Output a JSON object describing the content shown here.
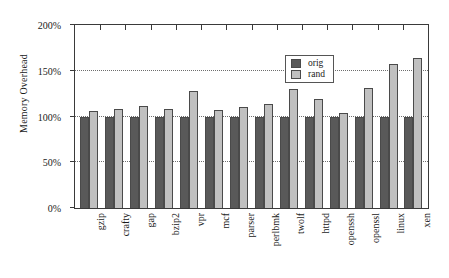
{
  "chart_data": {
    "type": "bar",
    "title": "",
    "xlabel": "",
    "ylabel": "Memory Overhead",
    "ylim": [
      0,
      200
    ],
    "yticks": [
      0,
      50,
      100,
      150,
      200
    ],
    "ytick_labels": [
      "0%",
      "50%",
      "100%",
      "150%",
      "200%"
    ],
    "grid": true,
    "grid_style": "dotted-horizontal",
    "legend_position": "top-right-inside",
    "categories": [
      "gzip",
      "crafty",
      "gap",
      "bzip2",
      "vpr",
      "mcf",
      "parser",
      "perlbmk",
      "twolf",
      "httpd",
      "openssh",
      "openssl",
      "linux",
      "xen"
    ],
    "series": [
      {
        "name": "orig",
        "color": "#595959",
        "values": [
          100,
          100,
          100,
          100,
          100,
          100,
          100,
          100,
          100,
          100,
          100,
          100,
          100,
          100
        ]
      },
      {
        "name": "rand",
        "color": "#c0c0c0",
        "values": [
          106,
          108,
          111,
          108,
          128,
          107,
          110,
          114,
          130,
          119,
          104,
          131,
          157,
          164
        ]
      }
    ]
  },
  "legend": {
    "items": [
      {
        "label": "orig",
        "swatch": "orig"
      },
      {
        "label": "rand",
        "swatch": "rand"
      }
    ]
  },
  "colors": {
    "orig": "#595959",
    "rand": "#c0c0c0",
    "axis": "#3a3a3a",
    "grid": "#6e6e6e",
    "text": "#1a1a1a",
    "background": "#ffffff"
  }
}
